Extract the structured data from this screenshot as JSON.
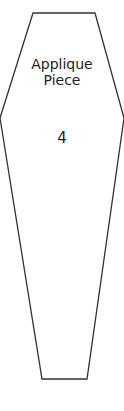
{
  "piece": {
    "title_line1": "Applique",
    "title_line2": "Piece",
    "number": "4",
    "stroke_color": "#333333",
    "fill_color": "#ffffff"
  }
}
